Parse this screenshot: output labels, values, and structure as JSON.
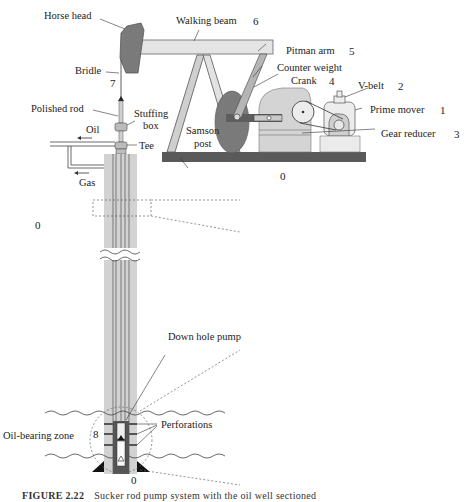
{
  "figure": {
    "caption_label": "FIGURE 2.22",
    "caption_text": "Sucker rod pump system with the oil well sectioned",
    "colors": {
      "dark_gray": "#6b6b6b",
      "mid_gray": "#9a9a9a",
      "light_gray": "#d8d8d8",
      "casing_gray": "#cfcfcf",
      "base_dark": "#5a5a5a",
      "line": "#333333"
    }
  },
  "surface_unit": {
    "labels": {
      "horse_head": "Horse head",
      "walking_beam": "Walking beam",
      "pitman_arm": "Pitman arm",
      "counter_weight": "Counter weight",
      "crank": "Crank",
      "v_belt": "V-belt",
      "prime_mover": "Prime mover",
      "gear_reducer": "Gear reducer",
      "samson_post_line1": "Samson",
      "samson_post_line2": "post",
      "bridle": "Bridle",
      "polished_rod": "Polished rod",
      "stuffing_box_line1": "Stuffing",
      "stuffing_box_line2": "box",
      "tee": "Tee",
      "oil": "Oil",
      "gas": "Gas"
    },
    "numbers": {
      "walking_beam": "6",
      "pitman_arm": "5",
      "crank": "4",
      "v_belt": "2",
      "prime_mover": "1",
      "gear_reducer": "3",
      "bridle": "7",
      "base_ground": "0"
    }
  },
  "well": {
    "labels": {
      "down_hole_pump": "Down hole pump",
      "perforations": "Perforations",
      "oil_bearing_zone": "Oil-bearing zone"
    },
    "numbers": {
      "surface_left": "0",
      "pump_zone": "8",
      "bottom": "0"
    }
  }
}
